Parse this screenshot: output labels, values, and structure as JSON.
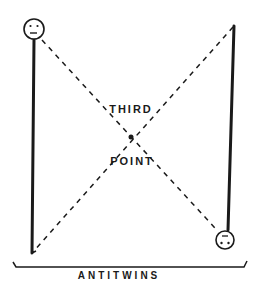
{
  "diagram": {
    "labels": {
      "center_top": "THIRD",
      "center_bottom": "POINT",
      "bracket": "ANTITWINS"
    },
    "nodes": [
      {
        "id": "left-twin",
        "face": "frowning-face-icon",
        "position": "top-left",
        "orientation": "upright"
      },
      {
        "id": "right-twin",
        "face": "upside-down-face-icon",
        "position": "bottom-right",
        "orientation": "inverted"
      },
      {
        "id": "third-point",
        "position": "center",
        "marker": "dot"
      }
    ],
    "edges": [
      {
        "from": "left-twin",
        "to": "right-twin",
        "style": "dashed"
      },
      {
        "from": "right-top",
        "to": "left-bottom",
        "style": "dashed"
      }
    ],
    "colors": {
      "ink": "#1a1a1a",
      "background": "#ffffff"
    }
  }
}
